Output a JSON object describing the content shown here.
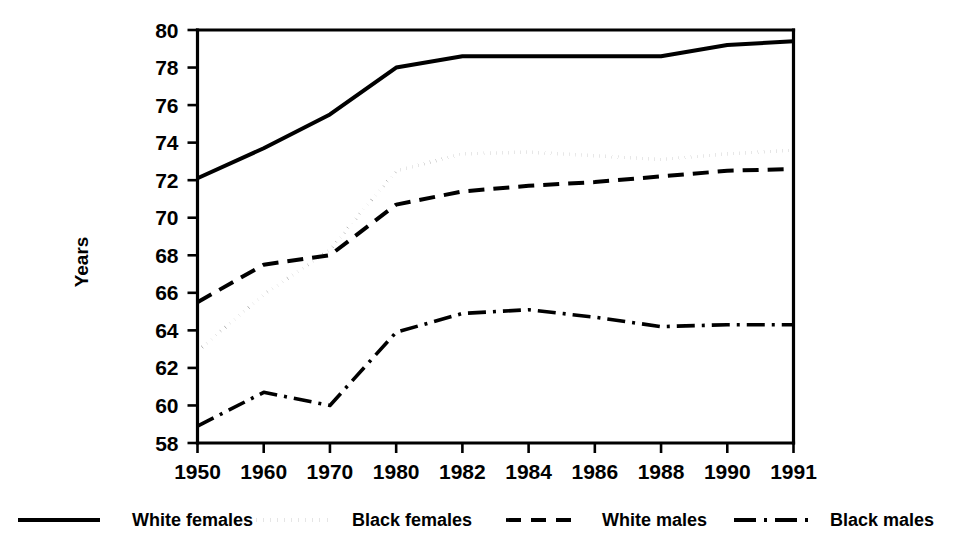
{
  "chart_data": {
    "type": "line",
    "title": "",
    "subtitle": "",
    "xlabel": "",
    "ylabel": "Years",
    "categories": [
      "1950",
      "1960",
      "1970",
      "1980",
      "1982",
      "1984",
      "1986",
      "1988",
      "1990",
      "1991"
    ],
    "ylim": [
      58,
      80
    ],
    "yticks": [
      58,
      60,
      62,
      64,
      66,
      68,
      70,
      72,
      74,
      76,
      78,
      80
    ],
    "ytick_labels": [
      "58",
      "60",
      "62",
      "64",
      "66",
      "68",
      "70",
      "72",
      "74",
      "76",
      "78",
      "80"
    ],
    "grid": false,
    "legend_position": "bottom",
    "series": [
      {
        "name": "White females",
        "line_style": "solid",
        "color": "#000000",
        "stroke_width": 4.0,
        "dasharray": "",
        "values": [
          72.1,
          73.7,
          75.5,
          78.0,
          78.6,
          78.6,
          78.6,
          78.6,
          79.2,
          79.4
        ]
      },
      {
        "name": "Black females",
        "line_style": "dotted",
        "color": "#000000",
        "stroke_width": 3.6,
        "dasharray": "0.1 6",
        "values": [
          62.9,
          65.9,
          68.3,
          72.5,
          73.4,
          73.5,
          73.3,
          73.1,
          73.4,
          73.6
        ]
      },
      {
        "name": "White males",
        "line_style": "dashed",
        "color": "#000000",
        "stroke_width": 4.0,
        "dasharray": "16 9",
        "values": [
          65.5,
          67.5,
          68.0,
          70.7,
          71.4,
          71.7,
          71.9,
          72.2,
          72.5,
          72.6
        ]
      },
      {
        "name": "Black males",
        "line_style": "dash-dot",
        "color": "#000000",
        "stroke_width": 3.6,
        "dasharray": "18 7 3 7",
        "values": [
          58.9,
          60.7,
          60.0,
          63.9,
          64.9,
          65.1,
          64.7,
          64.2,
          64.3,
          64.3
        ]
      }
    ]
  },
  "legend": {
    "items": [
      {
        "label": "White females",
        "style": "solid"
      },
      {
        "label": "Black females",
        "style": "dotted"
      },
      {
        "label": "White males",
        "style": "dashed"
      },
      {
        "label": "Black males",
        "style": "dash-dot"
      }
    ]
  }
}
